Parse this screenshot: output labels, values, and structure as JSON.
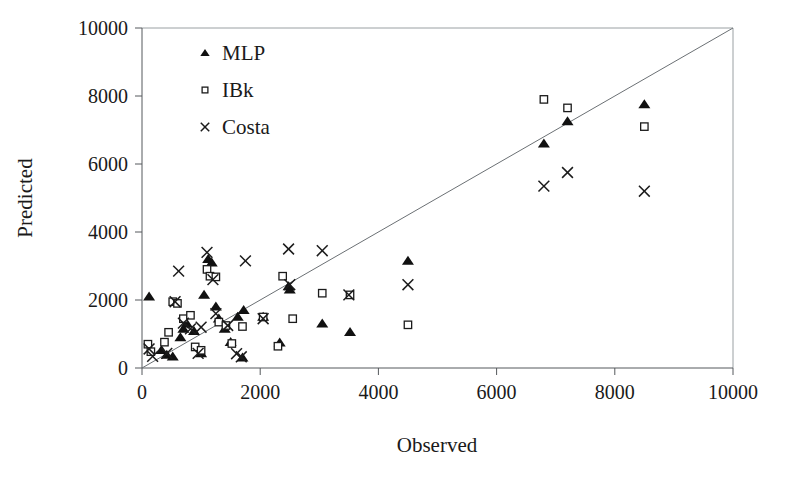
{
  "chart_data": {
    "type": "scatter",
    "title": "",
    "xlabel": "Observed",
    "ylabel": "Predicted",
    "xlim": [
      0,
      10000
    ],
    "ylim": [
      0,
      10000
    ],
    "xticks": [
      0,
      2000,
      4000,
      6000,
      8000,
      10000
    ],
    "yticks": [
      0,
      2000,
      4000,
      6000,
      8000,
      10000
    ],
    "xtick_labels": [
      "0",
      "2000",
      "4000",
      "6000",
      "8000",
      "10000"
    ],
    "ytick_labels": [
      "0",
      "2000",
      "4000",
      "6000",
      "8000",
      "10000"
    ],
    "grid": false,
    "legend_position": "upper-left",
    "reference_line": {
      "name": "identity-line",
      "from": [
        0,
        0
      ],
      "to": [
        10000,
        10000
      ]
    },
    "series": [
      {
        "name": "MLP",
        "marker": "filled-triangle",
        "color": "#111111",
        "points": [
          [
            120,
            2100
          ],
          [
            330,
            520
          ],
          [
            420,
            380
          ],
          [
            520,
            330
          ],
          [
            650,
            900
          ],
          [
            700,
            1150
          ],
          [
            760,
            1300
          ],
          [
            880,
            1080
          ],
          [
            1000,
            430
          ],
          [
            1050,
            2150
          ],
          [
            1120,
            3200
          ],
          [
            1180,
            3100
          ],
          [
            1250,
            1800
          ],
          [
            1300,
            1450
          ],
          [
            1400,
            1150
          ],
          [
            1500,
            760
          ],
          [
            1620,
            1500
          ],
          [
            1700,
            300
          ],
          [
            1720,
            1700
          ],
          [
            2050,
            1500
          ],
          [
            2330,
            740
          ],
          [
            2480,
            2400
          ],
          [
            2500,
            2300
          ],
          [
            3050,
            1300
          ],
          [
            3520,
            1050
          ],
          [
            4500,
            3150
          ],
          [
            6800,
            6600
          ],
          [
            7200,
            7250
          ],
          [
            8500,
            7750
          ]
        ]
      },
      {
        "name": "IBk",
        "marker": "open-square",
        "color": "#1b1b1b",
        "points": [
          [
            100,
            700
          ],
          [
            150,
            480
          ],
          [
            380,
            760
          ],
          [
            450,
            1050
          ],
          [
            520,
            1950
          ],
          [
            600,
            1900
          ],
          [
            700,
            1450
          ],
          [
            820,
            1550
          ],
          [
            900,
            620
          ],
          [
            1000,
            520
          ],
          [
            1100,
            2900
          ],
          [
            1150,
            2700
          ],
          [
            1250,
            2680
          ],
          [
            1300,
            1350
          ],
          [
            1420,
            1250
          ],
          [
            1520,
            720
          ],
          [
            1700,
            1220
          ],
          [
            2050,
            1500
          ],
          [
            2300,
            640
          ],
          [
            2380,
            2700
          ],
          [
            2550,
            1450
          ],
          [
            3050,
            2200
          ],
          [
            3520,
            2150
          ],
          [
            4500,
            1270
          ],
          [
            6800,
            7900
          ],
          [
            7200,
            7650
          ],
          [
            8500,
            7100
          ]
        ]
      },
      {
        "name": "Costa",
        "marker": "cross-x",
        "color": "#1b1b1b",
        "points": [
          [
            120,
            560
          ],
          [
            180,
            340
          ],
          [
            420,
            430
          ],
          [
            560,
            1950
          ],
          [
            620,
            2850
          ],
          [
            700,
            1320
          ],
          [
            820,
            1150
          ],
          [
            950,
            430
          ],
          [
            1000,
            1200
          ],
          [
            1100,
            3400
          ],
          [
            1200,
            2600
          ],
          [
            1250,
            1600
          ],
          [
            1450,
            1250
          ],
          [
            1600,
            420
          ],
          [
            1680,
            330
          ],
          [
            1750,
            3150
          ],
          [
            2050,
            1450
          ],
          [
            2480,
            3500
          ],
          [
            2500,
            2450
          ],
          [
            3050,
            3450
          ],
          [
            3500,
            2150
          ],
          [
            4500,
            2450
          ],
          [
            6800,
            5350
          ],
          [
            7200,
            5750
          ],
          [
            8500,
            5200
          ]
        ]
      }
    ],
    "legend_entries": [
      {
        "label": "MLP",
        "marker": "filled-triangle"
      },
      {
        "label": "IBk",
        "marker": "open-square"
      },
      {
        "label": "Costa",
        "marker": "cross-x"
      }
    ]
  },
  "colors": {
    "background": "#ffffff",
    "ink": "#1a1a1a",
    "axis": "#55595c",
    "frame": "#9aa0a3",
    "reference_line": "#6b7074"
  }
}
